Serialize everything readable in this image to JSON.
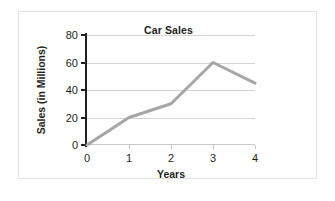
{
  "chart_data": {
    "type": "line",
    "title": "Car Sales",
    "xlabel": "Years",
    "ylabel": "Sales (in Millions)",
    "x": [
      0,
      1,
      2,
      3,
      4
    ],
    "values": [
      0,
      20,
      30,
      60,
      45
    ],
    "series": [
      {
        "name": "Car Sales",
        "values": [
          0,
          20,
          30,
          60,
          45
        ]
      }
    ],
    "xlim": [
      0,
      4
    ],
    "ylim": [
      0,
      80
    ],
    "xticks": [
      "0",
      "1",
      "2",
      "3",
      "4"
    ],
    "yticks": [
      "0",
      "20",
      "40",
      "60",
      "80"
    ],
    "grid": true,
    "legend": false,
    "line_color": "#a6a6a6",
    "axis_color": "#231f20",
    "grid_color": "#d4d4d4"
  }
}
